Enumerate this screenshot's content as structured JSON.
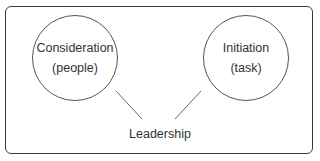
{
  "diagram": {
    "type": "concept-diagram",
    "nodes": [
      {
        "id": "consideration",
        "line1": "Consideration",
        "line2": "(people)"
      },
      {
        "id": "initiation",
        "line1": "Initiation",
        "line2": "(task)"
      }
    ],
    "center_label": "Leadership",
    "edges": [
      {
        "from": "consideration",
        "to": "leadership"
      },
      {
        "from": "initiation",
        "to": "leadership"
      }
    ],
    "colors": {
      "stroke": "#555555",
      "frame": "#3a3a3a",
      "text": "#333333",
      "background": "#ffffff"
    }
  }
}
